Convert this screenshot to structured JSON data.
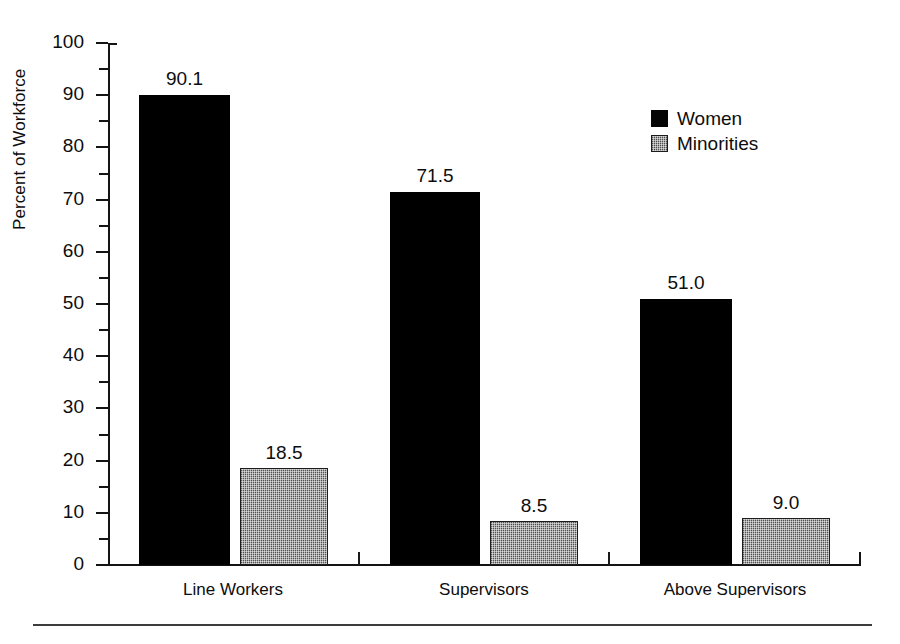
{
  "chart_data": {
    "type": "bar",
    "title": "",
    "xlabel": "",
    "ylabel": "Percent of Workforce",
    "categories": [
      "Line Workers",
      "Supervisors",
      "Above Supervisors"
    ],
    "series": [
      {
        "name": "Women",
        "color": "#000000",
        "values": [
          90.1,
          71.5,
          51.0
        ],
        "value_labels": [
          "90.1",
          "71.5",
          "51.0"
        ]
      },
      {
        "name": "Minorities",
        "color": "#8d8d8d",
        "values": [
          18.5,
          8.5,
          9.0
        ],
        "value_labels": [
          "18.5",
          "8.5",
          "9.0"
        ]
      }
    ],
    "ylim": [
      0,
      100
    ],
    "ytick_labels": [
      "100",
      "90",
      "80",
      "70",
      "60",
      "50",
      "40",
      "30",
      "20",
      "10",
      "0"
    ],
    "ytick_values": [
      100,
      90,
      80,
      70,
      60,
      50,
      40,
      30,
      20,
      10,
      0
    ],
    "grid": false,
    "legend_position": "upper right"
  },
  "axis": {
    "y_title": "Percent of Workforce"
  },
  "legend": {
    "entries": [
      {
        "label": "Women"
      },
      {
        "label": "Minorities"
      }
    ]
  }
}
